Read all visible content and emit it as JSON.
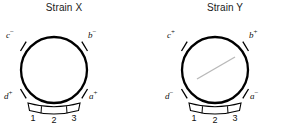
{
  "figure": {
    "background_color": "#ffffff",
    "stroke_color": "#000000",
    "faint_line_color": "#b9b9b9"
  },
  "panels": [
    {
      "id": "strain-x",
      "title": "Strain X",
      "circle": {
        "cx": 54,
        "cy": 70,
        "r": 33
      },
      "loci": [
        {
          "id": "c",
          "gene": "c",
          "sign": "−",
          "label": "c−",
          "angle_deg": 135,
          "label_x": 9,
          "label_y": 33
        },
        {
          "id": "b",
          "gene": "b",
          "sign": "−",
          "label": "b−",
          "angle_deg": 45,
          "label_x": 89,
          "label_y": 33
        },
        {
          "id": "d",
          "gene": "d",
          "sign": "+",
          "label": "d+",
          "angle_deg": 225,
          "label_x": 6,
          "label_y": 95
        },
        {
          "id": "a",
          "gene": "a",
          "sign": "+",
          "label": "a+",
          "angle_deg": 315,
          "label_x": 90,
          "label_y": 95
        }
      ],
      "segments": [
        {
          "label": "1",
          "x": 33,
          "y": 116
        },
        {
          "label": "2",
          "x": 54,
          "y": 118
        },
        {
          "label": "3",
          "x": 74,
          "y": 116
        }
      ],
      "has_internal_line": false
    },
    {
      "id": "strain-y",
      "title": "Strain Y",
      "circle": {
        "cx": 70,
        "cy": 70,
        "r": 33
      },
      "loci": [
        {
          "id": "c",
          "gene": "c",
          "sign": "+",
          "label": "c+",
          "angle_deg": 135,
          "label_x": 25,
          "label_y": 33
        },
        {
          "id": "b",
          "gene": "b",
          "sign": "+",
          "label": "b+",
          "angle_deg": 45,
          "label_x": 105,
          "label_y": 33
        },
        {
          "id": "d",
          "gene": "d",
          "sign": "−",
          "label": "d−",
          "angle_deg": 225,
          "label_x": 21,
          "label_y": 95
        },
        {
          "id": "a",
          "gene": "a",
          "sign": "−",
          "label": "a−",
          "angle_deg": 315,
          "label_x": 107,
          "label_y": 95
        }
      ],
      "segments": [
        {
          "label": "1",
          "x": 49,
          "y": 116
        },
        {
          "label": "2",
          "x": 70,
          "y": 118
        },
        {
          "label": "3",
          "x": 90,
          "y": 116
        }
      ],
      "has_internal_line": true,
      "internal_line": {
        "x1": 52,
        "y1": 79,
        "x2": 90,
        "y2": 57
      }
    }
  ]
}
